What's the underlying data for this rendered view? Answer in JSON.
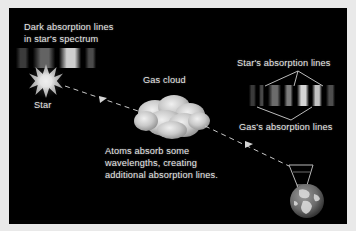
{
  "figure": {
    "background_color": "#e9e9e9",
    "panel_color": "#000000",
    "text_color": "#e6e6e6"
  },
  "labels": {
    "top_left_line1": "Dark absorption lines",
    "top_left_line2": "in star's spectrum",
    "star": "Star",
    "gas_cloud": "Gas cloud",
    "stars_absorption_lines": "Star's absorption lines",
    "gass_absorption_lines": "Gas's absorption lines",
    "caption_line1": "Atoms absorb some",
    "caption_line2": "wavelengths, creating",
    "caption_line3": "additional absorption lines."
  },
  "icons": {
    "star": "star-burst-icon",
    "cloud": "gas-cloud-icon",
    "earth": "earth-globe-icon",
    "telescope": "telescope-icon",
    "arrow": "light-ray-arrow-icon"
  },
  "spectra": {
    "star_spectrum": {
      "name": "star-spectrum-strip",
      "x": 16,
      "y": 48,
      "width": 80,
      "height": 20,
      "bands": [
        {
          "left": 0,
          "width": 13,
          "color": "#3b3b3b"
        },
        {
          "left": 13,
          "width": 4,
          "color": "#000000"
        },
        {
          "left": 17,
          "width": 22,
          "color": "#636363"
        },
        {
          "left": 39,
          "width": 4,
          "color": "#000000"
        },
        {
          "left": 43,
          "width": 22,
          "color": "#cfcfcf"
        },
        {
          "left": 65,
          "width": 4,
          "color": "#000000"
        },
        {
          "left": 69,
          "width": 11,
          "color": "#4a4a4a"
        }
      ],
      "absorption_lines": [
        13,
        39,
        65
      ]
    },
    "combined_spectrum": {
      "name": "combined-spectrum-strip",
      "x": 249,
      "y": 85,
      "width": 86,
      "height": 21,
      "bands": [
        {
          "left": 0,
          "width": 7,
          "color": "#3a3a3a"
        },
        {
          "left": 7,
          "width": 3,
          "color": "#000000"
        },
        {
          "left": 10,
          "width": 5,
          "color": "#474747"
        },
        {
          "left": 15,
          "width": 4,
          "color": "#000000"
        },
        {
          "left": 19,
          "width": 13,
          "color": "#6b6b6b"
        },
        {
          "left": 32,
          "width": 3,
          "color": "#000000"
        },
        {
          "left": 35,
          "width": 9,
          "color": "#7d7d7d"
        },
        {
          "left": 44,
          "width": 4,
          "color": "#000000"
        },
        {
          "left": 48,
          "width": 12,
          "color": "#d4d4d4"
        },
        {
          "left": 60,
          "width": 3,
          "color": "#000000"
        },
        {
          "left": 63,
          "width": 10,
          "color": "#c2c2c2"
        },
        {
          "left": 73,
          "width": 4,
          "color": "#000000"
        },
        {
          "left": 77,
          "width": 9,
          "color": "#4e4e4e"
        }
      ],
      "star_line_positions": [
        15,
        44,
        73
      ],
      "gas_line_positions": [
        7,
        32,
        60
      ]
    }
  },
  "leaders": {
    "star_label_origin_x": 298,
    "star_label_origin_y": 72,
    "star_targets_x": [
      264,
      293,
      322
    ],
    "gas_label_origin_x": 290,
    "gas_label_origin_y": 122,
    "gas_targets_x": [
      256,
      312
    ]
  }
}
